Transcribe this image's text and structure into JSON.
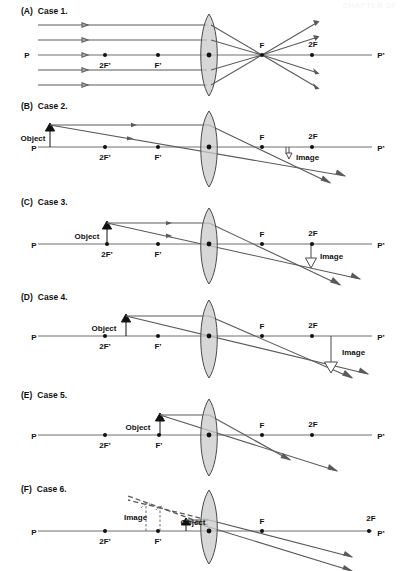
{
  "watermark": "CHAPTER 24",
  "figure": {
    "type": "optics-ray-diagram-set",
    "lens_type": "converging-convex",
    "axis_labels": {
      "left": "P",
      "right": "P’"
    },
    "focal_labels": {
      "near_left": "F’",
      "far_left": "2F’",
      "near_right": "F",
      "far_right": "2F"
    },
    "object_label": "Object",
    "image_label": "Image"
  },
  "cases": [
    {
      "key": "(A)",
      "name": "Case 1.",
      "object": null,
      "image": null,
      "description": "Parallel rays converge at F"
    },
    {
      "key": "(B)",
      "name": "Case 2.",
      "object": "Object",
      "image": "Image",
      "description": "Object beyond 2F’; image between F and 2F, reduced, inverted"
    },
    {
      "key": "(C)",
      "name": "Case 3.",
      "object": "Object",
      "image": "Image",
      "description": "Object at 2F’; image at 2F, same size, inverted"
    },
    {
      "key": "(D)",
      "name": "Case 4.",
      "object": "Object",
      "image": "Image",
      "description": "Object between 2F’ and F’; image beyond 2F, enlarged, inverted"
    },
    {
      "key": "(E)",
      "name": "Case 5.",
      "object": "Object",
      "image": null,
      "description": "Object at F’; rays emerge parallel, no image"
    },
    {
      "key": "(F)",
      "name": "Case 6.",
      "object": "Object",
      "image": "Image",
      "description": "Object inside F’; virtual enlarged upright image on object side"
    }
  ]
}
